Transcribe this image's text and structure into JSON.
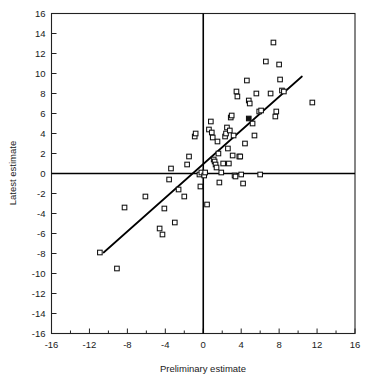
{
  "chart_data": {
    "type": "scatter",
    "title": "",
    "xlabel": "Preliminary estimate",
    "ylabel": "Latest estimate",
    "xlim": [
      -16,
      16
    ],
    "ylim": [
      -16,
      16
    ],
    "xticks": [
      -16,
      -12,
      -8,
      -4,
      0,
      4,
      8,
      12,
      16
    ],
    "yticks": [
      -16,
      -14,
      -12,
      -10,
      -8,
      -6,
      -4,
      -2,
      0,
      2,
      4,
      6,
      8,
      10,
      12,
      14,
      16
    ],
    "xtick_labels": [
      "-16",
      "-12",
      "-8",
      "-4",
      "0",
      "4",
      "8",
      "12",
      "16"
    ],
    "ytick_labels": [
      "-16",
      "-14",
      "-12",
      "-10",
      "-8",
      "-6",
      "-4",
      "-2",
      "0",
      "2",
      "4",
      "6",
      "8",
      "10",
      "12",
      "14",
      "16"
    ],
    "xtick_step": 4,
    "ytick_step": 2,
    "grid": false,
    "legend": null,
    "marker_style": "open-square",
    "marker_size": 4.6,
    "zero_axes": true,
    "series": [
      {
        "name": "observations",
        "marker": "open-square",
        "points": [
          [
            -10.9,
            -7.9
          ],
          [
            -9.1,
            -9.5
          ],
          [
            -8.3,
            -3.4
          ],
          [
            -6.1,
            -2.3
          ],
          [
            -4.6,
            -5.5
          ],
          [
            -4.3,
            -6.1
          ],
          [
            -4.1,
            -3.5
          ],
          [
            -3.6,
            -0.6
          ],
          [
            -3.4,
            0.5
          ],
          [
            -3.0,
            -4.9
          ],
          [
            -2.6,
            -1.6
          ],
          [
            -2.0,
            -2.3
          ],
          [
            -1.7,
            0.9
          ],
          [
            -1.5,
            1.7
          ],
          [
            -0.9,
            3.7
          ],
          [
            -0.8,
            4.0
          ],
          [
            -0.4,
            -0.1
          ],
          [
            -0.3,
            -1.3
          ],
          [
            -0.2,
            0.1
          ],
          [
            0.1,
            -0.2
          ],
          [
            0.2,
            0.1
          ],
          [
            0.4,
            -3.1
          ],
          [
            0.6,
            4.4
          ],
          [
            0.8,
            5.2
          ],
          [
            0.9,
            4.1
          ],
          [
            1.0,
            3.6
          ],
          [
            1.1,
            1.4
          ],
          [
            1.2,
            1.2
          ],
          [
            1.3,
            0.9
          ],
          [
            1.4,
            0.6
          ],
          [
            1.5,
            3.2
          ],
          [
            1.6,
            2.0
          ],
          [
            1.7,
            -0.9
          ],
          [
            1.9,
            0.1
          ],
          [
            2.1,
            1.0
          ],
          [
            2.3,
            3.7
          ],
          [
            2.4,
            4.0
          ],
          [
            2.5,
            4.6
          ],
          [
            2.6,
            2.5
          ],
          [
            2.7,
            1.0
          ],
          [
            2.8,
            4.3
          ],
          [
            2.9,
            5.6
          ],
          [
            3.0,
            5.8
          ],
          [
            3.1,
            1.8
          ],
          [
            3.2,
            3.8
          ],
          [
            3.3,
            -0.2
          ],
          [
            3.4,
            -0.3
          ],
          [
            3.5,
            8.2
          ],
          [
            3.6,
            7.7
          ],
          [
            3.8,
            1.7
          ],
          [
            3.9,
            1.7
          ],
          [
            4.0,
            -0.1
          ],
          [
            4.2,
            -1.0
          ],
          [
            4.4,
            3.0
          ],
          [
            4.6,
            9.3
          ],
          [
            4.8,
            7.3
          ],
          [
            4.9,
            7.0
          ],
          [
            5.2,
            5.0
          ],
          [
            5.4,
            3.8
          ],
          [
            5.6,
            8.0
          ],
          [
            5.9,
            6.2
          ],
          [
            6.0,
            -0.1
          ],
          [
            6.1,
            6.3
          ],
          [
            6.6,
            11.2
          ],
          [
            7.1,
            8.0
          ],
          [
            7.4,
            13.1
          ],
          [
            7.6,
            5.7
          ],
          [
            7.7,
            6.2
          ],
          [
            8.0,
            10.9
          ],
          [
            8.1,
            9.4
          ],
          [
            8.3,
            8.3
          ],
          [
            8.5,
            8.2
          ],
          [
            11.5,
            7.1
          ]
        ]
      },
      {
        "name": "highlighted-observation",
        "marker": "filled-square",
        "points": [
          [
            4.8,
            5.5
          ]
        ]
      }
    ],
    "fit_line": {
      "label": "regression line",
      "x0": -10.5,
      "y0": -7.9,
      "x1": 10.4,
      "y1": 9.7
    }
  }
}
